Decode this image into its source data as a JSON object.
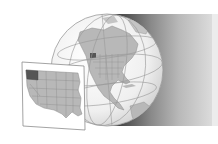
{
  "illustration": {
    "subject": "Globe centered on North America with inset map of the western United States",
    "highlighted_region": "Oregon",
    "colors": {
      "background": "#ffffff",
      "globe_ocean": "#f4f4f4",
      "land": "#b8b8b8",
      "highlight": "#555555",
      "graticule": "#9a9a9a",
      "shadow_dark": "#2e2e2e",
      "shadow_light": "#e2e2e2",
      "inset_border": "#8c8c8c"
    },
    "caption": ""
  }
}
